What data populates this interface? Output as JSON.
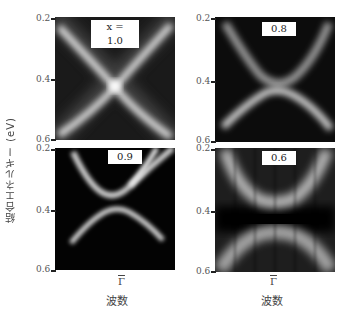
{
  "figure": {
    "y_axis_label": "結合エネルギー (eV)",
    "x_axis_label": "波数",
    "x_tick_label": "Γ",
    "y_ticks": [
      "0.2",
      "0.4",
      "0.6"
    ],
    "panels": [
      {
        "position": "top-left",
        "label": "x = 1.0",
        "description": "Bands cross at Γ (gapless Dirac cone)"
      },
      {
        "position": "top-right",
        "label": "0.8",
        "description": "Small gap opens at Γ"
      },
      {
        "position": "bottom-left",
        "label": "0.9",
        "description": "Very small gap at Γ"
      },
      {
        "position": "bottom-right",
        "label": "0.6",
        "description": "Large gap at Γ"
      }
    ]
  },
  "colors": {
    "background": "#ffffff",
    "panel_background": "#050505",
    "band": "#e8e8e8"
  }
}
